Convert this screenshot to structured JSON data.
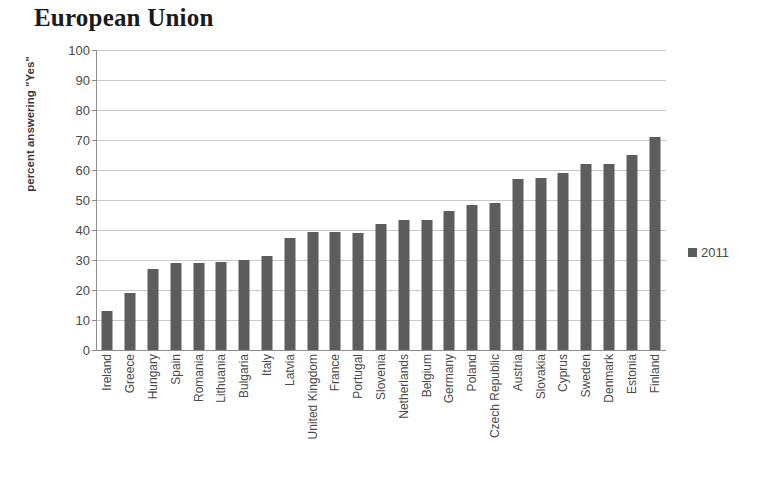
{
  "chart_data": {
    "type": "bar",
    "title": "European Union",
    "xlabel": "",
    "ylabel": "percent answering \"Yes\"",
    "ylim": [
      0,
      100
    ],
    "ytick_step": 10,
    "yticks": [
      0,
      10,
      20,
      30,
      40,
      50,
      60,
      70,
      80,
      90,
      100
    ],
    "grid": true,
    "legend_position": "right",
    "legend": [
      "2011"
    ],
    "series": [
      {
        "name": "2011",
        "color": "#5d5d5d",
        "values": [
          13,
          19,
          27,
          29,
          29,
          29.5,
          30,
          31.5,
          37.5,
          39.5,
          39.5,
          39,
          42,
          43.5,
          43.5,
          46.5,
          48.5,
          49,
          57,
          57.5,
          59,
          62,
          62,
          65,
          71
        ]
      }
    ],
    "categories": [
      "Ireland",
      "Greece",
      "Hungary",
      "Spain",
      "Romania",
      "Lithuania",
      "Bulgaria",
      "Italy",
      "Latvia",
      "United Kingdom",
      "France",
      "Portugal",
      "Slovenia",
      "Netherlands",
      "Belgium",
      "Germany",
      "Poland",
      "Czech Republic",
      "Austria",
      "Slovakia",
      "Cyprus",
      "Sweden",
      "Denmark",
      "Estonia",
      "Finland"
    ]
  }
}
